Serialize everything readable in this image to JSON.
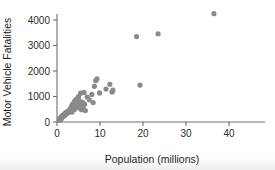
{
  "chart_data": {
    "type": "scatter",
    "title": "",
    "xlabel": "Population (millions)",
    "ylabel": "Motor Vehicle Fatalities",
    "xlim": [
      0,
      48
    ],
    "ylim": [
      0,
      4600
    ],
    "xticks": [
      0,
      10,
      20,
      30,
      40
    ],
    "yticks": [
      0,
      1000,
      2000,
      3000,
      4000
    ],
    "grid": false,
    "legend": null,
    "marker": {
      "color": "#8a8a8a",
      "shape": "circle",
      "size_px": 2.6
    },
    "series": [
      {
        "name": "US states",
        "points": [
          [
            0.5,
            60
          ],
          [
            0.6,
            110
          ],
          [
            0.7,
            140
          ],
          [
            0.8,
            90
          ],
          [
            0.9,
            180
          ],
          [
            1.0,
            130
          ],
          [
            1.1,
            220
          ],
          [
            1.2,
            190
          ],
          [
            1.3,
            260
          ],
          [
            1.4,
            230
          ],
          [
            1.6,
            300
          ],
          [
            1.7,
            250
          ],
          [
            1.8,
            330
          ],
          [
            2.0,
            290
          ],
          [
            2.1,
            380
          ],
          [
            2.3,
            340
          ],
          [
            2.5,
            420
          ],
          [
            2.6,
            360
          ],
          [
            2.8,
            460
          ],
          [
            3.0,
            410
          ],
          [
            3.1,
            530
          ],
          [
            3.3,
            470
          ],
          [
            3.4,
            620
          ],
          [
            3.5,
            390
          ],
          [
            3.6,
            700
          ],
          [
            3.8,
            560
          ],
          [
            4.0,
            480
          ],
          [
            4.1,
            820
          ],
          [
            4.3,
            640
          ],
          [
            4.5,
            900
          ],
          [
            4.6,
            740
          ],
          [
            4.8,
            560
          ],
          [
            5.0,
            1000
          ],
          [
            5.1,
            860
          ],
          [
            5.3,
            660
          ],
          [
            5.5,
            1130
          ],
          [
            5.7,
            480
          ],
          [
            5.9,
            780
          ],
          [
            6.1,
            560
          ],
          [
            6.3,
            1160
          ],
          [
            6.4,
            700
          ],
          [
            6.6,
            450
          ],
          [
            7.0,
            980
          ],
          [
            7.5,
            870
          ],
          [
            8.1,
            1080
          ],
          [
            8.4,
            760
          ],
          [
            8.7,
            1400
          ],
          [
            9.0,
            1620
          ],
          [
            9.3,
            1690
          ],
          [
            9.9,
            1140
          ],
          [
            11.4,
            1290
          ],
          [
            12.3,
            1480
          ],
          [
            12.8,
            1180
          ],
          [
            13.0,
            1250
          ],
          [
            18.5,
            3350
          ],
          [
            19.3,
            1450
          ],
          [
            23.5,
            3460
          ],
          [
            36.5,
            4250
          ]
        ]
      }
    ]
  },
  "axes": {
    "y_tick_labels": [
      "0",
      "1000",
      "2000",
      "3000",
      "4000"
    ],
    "x_tick_labels": [
      "0",
      "10",
      "20",
      "30",
      "40"
    ]
  }
}
